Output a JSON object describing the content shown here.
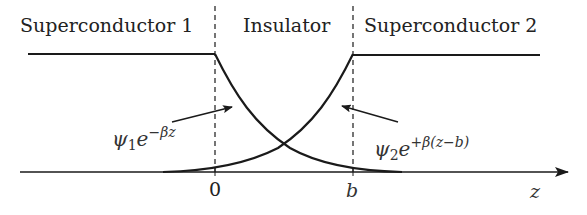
{
  "regions": {
    "left": "Superconductor 1",
    "middle": "Insulator",
    "right": "Superconductor 2"
  },
  "axis": {
    "variable": "z",
    "ticks": [
      "0",
      "b"
    ]
  },
  "wavefunctions": {
    "left": {
      "base": "ψ",
      "sub": "1",
      "e": "e",
      "exponent": "−βz"
    },
    "right": {
      "base": "ψ",
      "sub": "2",
      "e": "e",
      "exponent": "+β(z−b)"
    }
  },
  "colors": {
    "line": "#1a1a1a",
    "text": "#222222",
    "background": "#ffffff"
  }
}
